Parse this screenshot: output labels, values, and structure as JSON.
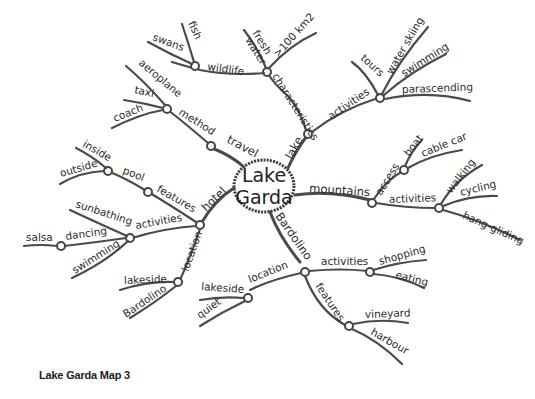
{
  "center": {
    "line1": "Lake",
    "line2": "Garda"
  },
  "caption": "Lake Garda Map 3",
  "branches": {
    "lake": {
      "label": "lake",
      "characteristics": {
        "label": "characteristics",
        "children": [
          "fresh",
          "water",
          ">100 km2"
        ]
      },
      "wildlife": {
        "label": "wildlife",
        "children": [
          "swans",
          "fish"
        ]
      },
      "activities": {
        "label": "activities",
        "children": [
          "tours",
          "water skiing",
          "swimming",
          "parascending"
        ]
      }
    },
    "travel": {
      "label": "travel",
      "method": {
        "label": "method",
        "children": [
          "aeroplane",
          "taxi",
          "coach"
        ]
      }
    },
    "hotel": {
      "label": "hotel",
      "features": {
        "label": "features",
        "pool": {
          "label": "pool",
          "children": [
            "inside",
            "outside"
          ]
        }
      },
      "activities": {
        "label": "activities",
        "children": [
          "sunbathing",
          "swimming"
        ],
        "dancing": {
          "label": "dancing",
          "children": [
            "salsa"
          ]
        }
      },
      "location": {
        "label": "location",
        "children": [
          "lakeside",
          "Bardolino"
        ]
      }
    },
    "mountains": {
      "label": "mountains",
      "access": {
        "label": "access",
        "children": [
          "boat",
          "cable car"
        ]
      },
      "activities": {
        "label": "activities",
        "children": [
          "walking",
          "cycling",
          "hang-gliding"
        ]
      }
    },
    "bardolino": {
      "label": "Bardolino",
      "location": {
        "label": "location",
        "children": [
          "lakeside",
          "quiet"
        ]
      },
      "activities": {
        "label": "activities",
        "children": [
          "shopping",
          "eating"
        ]
      },
      "features": {
        "label": "features",
        "children": [
          "vineyard",
          "harbour"
        ]
      }
    }
  }
}
